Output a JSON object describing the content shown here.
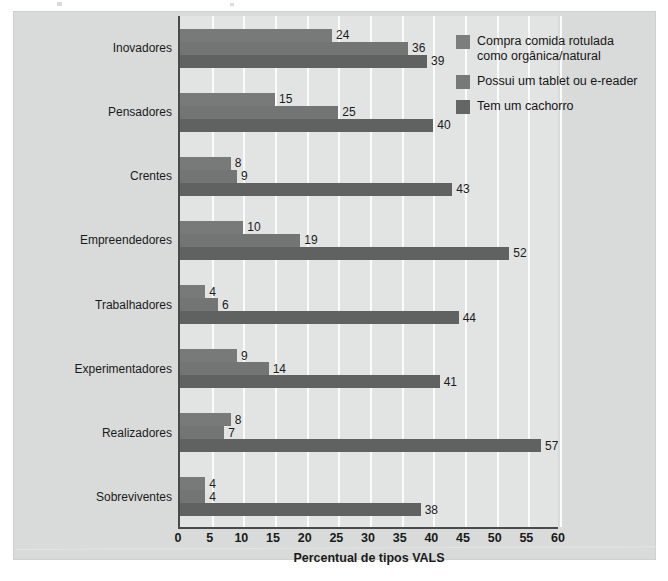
{
  "chart_data": {
    "type": "bar",
    "orientation": "horizontal",
    "title": "",
    "xlabel": "Percentual de tipos VALS",
    "ylabel": "",
    "xlim": [
      0,
      60
    ],
    "xticks": [
      0,
      5,
      10,
      15,
      20,
      25,
      30,
      35,
      40,
      45,
      50,
      55,
      60
    ],
    "grid": true,
    "legend_position": "right",
    "categories": [
      "Inovadores",
      "Pensadores",
      "Crentes",
      "Empreendedores",
      "Trabalhadores",
      "Experimentadores",
      "Realizadores",
      "Sobreviventes"
    ],
    "series": [
      {
        "name": "Compra comida rotulada como orgânica/natural",
        "color": "#777a79",
        "values": [
          24,
          15,
          8,
          10,
          4,
          9,
          8,
          4
        ]
      },
      {
        "name": "Possui um tablet ou e-reader",
        "color": "#727574",
        "values": [
          36,
          25,
          9,
          19,
          6,
          14,
          7,
          4
        ]
      },
      {
        "name": "Tem um cachorro",
        "color": "#5f6261",
        "values": [
          39,
          40,
          43,
          52,
          44,
          41,
          57,
          38
        ]
      }
    ]
  },
  "legend": {
    "items": [
      {
        "label": "Compra comida rotulada como orgânica/natural",
        "color": "#7b7e7d"
      },
      {
        "label": "Possui um tablet ou e-reader",
        "color": "#767978"
      },
      {
        "label": "Tem um cachorro",
        "color": "#636665"
      }
    ]
  },
  "axis": {
    "x_title": "Percentual de tipos VALS",
    "x_tick_labels": [
      "0",
      "5",
      "10",
      "15",
      "20",
      "25",
      "30",
      "35",
      "40",
      "45",
      "50",
      "55",
      "60"
    ]
  }
}
